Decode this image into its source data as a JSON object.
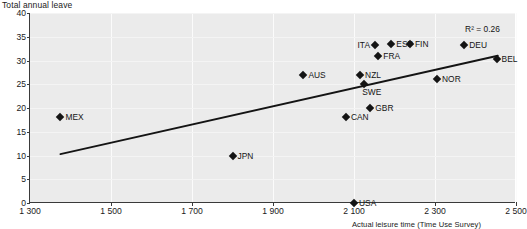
{
  "chart_data": {
    "type": "scatter",
    "title": "",
    "ylabel": "Total annual leave",
    "xlabel": "Actual leisure time (Time Use Survey)",
    "xlim": [
      1300,
      2500
    ],
    "ylim": [
      0,
      40
    ],
    "xticks": [
      "1 300",
      "1 500",
      "1 700",
      "1 900",
      "2 100",
      "2 300",
      "2 500"
    ],
    "xtick_values": [
      1300,
      1500,
      1700,
      1900,
      2100,
      2300,
      2500
    ],
    "yticks": [
      "0",
      "5",
      "10",
      "15",
      "20",
      "25",
      "30",
      "35",
      "40"
    ],
    "ytick_values": [
      0,
      5,
      10,
      15,
      20,
      25,
      30,
      35,
      40
    ],
    "grid": true,
    "legend": "none",
    "annotation": "R² = 0.26",
    "r_squared": 0.26,
    "trendline": {
      "x_start": 1375,
      "y_start": 10.3,
      "x_end": 2455,
      "y_end": 31.0
    },
    "points": [
      {
        "label": "MEX",
        "x": 1375,
        "y": 18.2,
        "label_side": "right"
      },
      {
        "label": "JPN",
        "x": 1800,
        "y": 10.0,
        "label_side": "right"
      },
      {
        "label": "AUS",
        "x": 1975,
        "y": 27.0,
        "label_side": "right"
      },
      {
        "label": "CAN",
        "x": 2080,
        "y": 18.2,
        "label_side": "right"
      },
      {
        "label": "USA",
        "x": 2100,
        "y": 0.0,
        "label_side": "right"
      },
      {
        "label": "NZL",
        "x": 2115,
        "y": 27.0,
        "label_side": "right"
      },
      {
        "label": "SWE",
        "x": 2125,
        "y": 25.0,
        "label_side": "below"
      },
      {
        "label": "GBR",
        "x": 2140,
        "y": 20.0,
        "label_side": "right"
      },
      {
        "label": "ITA",
        "x": 2152,
        "y": 33.2,
        "label_side": "left"
      },
      {
        "label": "FRA",
        "x": 2160,
        "y": 31.0,
        "label_side": "right"
      },
      {
        "label": "ESP",
        "x": 2192,
        "y": 33.4,
        "label_side": "right"
      },
      {
        "label": "FIN",
        "x": 2238,
        "y": 33.4,
        "label_side": "right"
      },
      {
        "label": "NOR",
        "x": 2305,
        "y": 26.2,
        "label_side": "right"
      },
      {
        "label": "DEU",
        "x": 2372,
        "y": 33.2,
        "label_side": "right"
      },
      {
        "label": "BEL",
        "x": 2452,
        "y": 30.4,
        "label_side": "right"
      }
    ]
  }
}
